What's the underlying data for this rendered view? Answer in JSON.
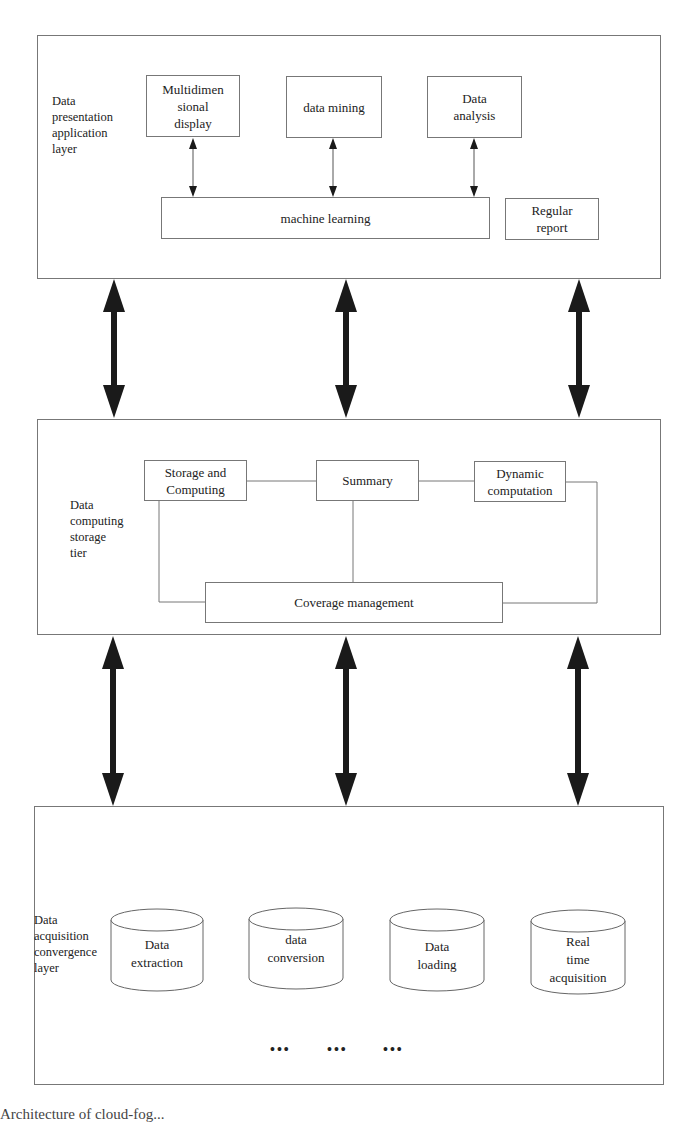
{
  "diagram": {
    "type": "layered-architecture",
    "layers": [
      {
        "id": "presentation",
        "label": "Data presentation application layer",
        "label_lines": [
          "Data",
          "presentation",
          "application",
          "layer"
        ],
        "boxes": [
          {
            "id": "multidim",
            "lines": [
              "Multidimen",
              "sional",
              "display"
            ]
          },
          {
            "id": "mining",
            "lines": [
              "data mining"
            ]
          },
          {
            "id": "analysis",
            "lines": [
              "Data",
              "analysis"
            ]
          },
          {
            "id": "ml",
            "lines": [
              "machine learning"
            ]
          },
          {
            "id": "report",
            "lines": [
              "Regular",
              "report"
            ]
          }
        ],
        "connections": [
          {
            "from": "multidim",
            "to": "ml",
            "type": "bidirectional-arrow"
          },
          {
            "from": "mining",
            "to": "ml",
            "type": "bidirectional-arrow"
          },
          {
            "from": "analysis",
            "to": "ml",
            "type": "bidirectional-arrow"
          }
        ]
      },
      {
        "id": "computing",
        "label": "Data computing storage tier",
        "label_lines": [
          "Data",
          "computing",
          "storage",
          "tier"
        ],
        "boxes": [
          {
            "id": "storage",
            "lines": [
              "Storage and",
              "Computing"
            ]
          },
          {
            "id": "summary",
            "lines": [
              "Summary"
            ]
          },
          {
            "id": "dynamic",
            "lines": [
              "Dynamic",
              "computation"
            ]
          },
          {
            "id": "coverage",
            "lines": [
              "Coverage management"
            ]
          }
        ],
        "connections": [
          {
            "from": "storage",
            "to": "summary",
            "type": "line"
          },
          {
            "from": "summary",
            "to": "dynamic",
            "type": "line"
          },
          {
            "from": "summary",
            "to": "coverage",
            "type": "line"
          },
          {
            "from": "storage",
            "to": "coverage",
            "type": "elbow-line"
          },
          {
            "from": "dynamic",
            "to": "coverage",
            "type": "elbow-line"
          }
        ]
      },
      {
        "id": "acquisition",
        "label": "Data acquisition convergence layer",
        "label_lines": [
          "Data",
          "acquisition",
          "convergence",
          "layer"
        ],
        "cylinders": [
          {
            "id": "extraction",
            "lines": [
              "Data",
              "extraction"
            ]
          },
          {
            "id": "conversion",
            "lines": [
              "data",
              "conversion"
            ]
          },
          {
            "id": "loading",
            "lines": [
              "Data",
              "loading"
            ]
          },
          {
            "id": "realtime",
            "lines": [
              "Real",
              "time",
              "acquisition"
            ]
          }
        ],
        "ellipsis": [
          "•••",
          "•••",
          "•••"
        ]
      }
    ],
    "inter_layer_arrows": [
      {
        "between": [
          "presentation",
          "computing"
        ],
        "count": 3,
        "type": "bold-bidirectional"
      },
      {
        "between": [
          "computing",
          "acquisition"
        ],
        "count": 3,
        "type": "bold-bidirectional"
      }
    ],
    "colors": {
      "line": "#777777",
      "arrow": "#1a1a1a",
      "text": "#222222",
      "background": "#ffffff"
    }
  },
  "caption": "Architecture of cloud-fog..."
}
